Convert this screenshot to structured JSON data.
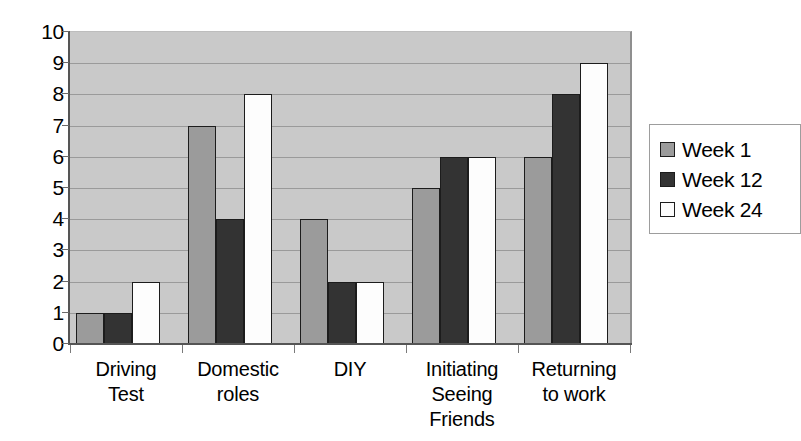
{
  "chart_data": {
    "type": "bar",
    "title": "",
    "xlabel": "",
    "ylabel": "",
    "ylim": [
      0,
      10
    ],
    "ytick_labels": [
      "10",
      "9",
      "8",
      "7",
      "6",
      "5",
      "4",
      "3",
      "2",
      "1",
      "0"
    ],
    "yticks": [
      10,
      9,
      8,
      7,
      6,
      5,
      4,
      3,
      2,
      1,
      0
    ],
    "grid": true,
    "legend_position": "right",
    "categories": [
      "Driving Test",
      "Domestic roles",
      "DIY",
      "Initiating Seeing Friends",
      "Returning to work"
    ],
    "category_label_lines": [
      [
        "Driving",
        "Test"
      ],
      [
        "Domestic",
        "roles"
      ],
      [
        "DIY"
      ],
      [
        "Initiating",
        "Seeing",
        "Friends"
      ],
      [
        "Returning",
        "to work"
      ]
    ],
    "series": [
      {
        "name": "Week 1",
        "color": "#9b9b9b",
        "values": [
          1,
          7,
          4,
          5,
          6
        ]
      },
      {
        "name": "Week 12",
        "color": "#333333",
        "values": [
          1,
          4,
          2,
          6,
          8
        ]
      },
      {
        "name": "Week 24",
        "color": "#fdfdfd",
        "values": [
          2,
          8,
          2,
          6,
          9
        ]
      }
    ]
  },
  "legend": {
    "items": [
      {
        "label": "Week 1"
      },
      {
        "label": "Week 12"
      },
      {
        "label": "Week 24"
      }
    ]
  },
  "colors": {
    "plot_background": "#c9c9c9",
    "gridline": "#9a9a9a",
    "axis": "#555555",
    "series_week_1": "#9b9b9b",
    "series_week_12": "#333333",
    "series_week_24": "#fdfdfd",
    "page_background": "#ffffff"
  }
}
